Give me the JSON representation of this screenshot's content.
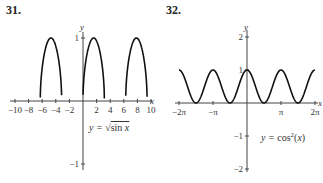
{
  "charts": [
    {
      "number": "31.",
      "equation": "y = √sin x"
    },
    {
      "number": "32.",
      "equation": "y = cos²(x)"
    }
  ],
  "chart_data": [
    {
      "type": "line",
      "title": "31.",
      "annotation": "y = √(sin x)",
      "xlabel": "x",
      "ylabel": "y",
      "xlim": [
        -10,
        10
      ],
      "ylim": [
        -1,
        1
      ],
      "x_ticks": [
        -10,
        -8,
        -6,
        -4,
        -2,
        2,
        4,
        6,
        8,
        10
      ],
      "y_ticks": [
        1,
        -1
      ],
      "grid": false,
      "series": [
        {
          "name": "sqrt(sin x)",
          "function": "sqrt(sin(x))",
          "domain_note": "defined only where sin x >= 0"
        }
      ]
    },
    {
      "type": "line",
      "title": "32.",
      "annotation": "y = cos²(x)",
      "xlabel": "x",
      "ylabel": "y",
      "xlim": [
        -6.283,
        6.283
      ],
      "ylim": [
        -2,
        2
      ],
      "x_ticks": [
        "-2π",
        "-π",
        "π",
        "2π"
      ],
      "y_ticks": [
        2,
        1,
        -1,
        -2
      ],
      "grid": false,
      "series": [
        {
          "name": "cos^2(x)",
          "function": "cos(x)^2"
        }
      ]
    }
  ]
}
